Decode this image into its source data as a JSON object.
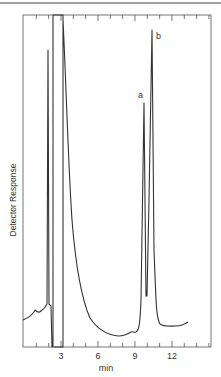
{
  "chart_data": {
    "type": "line",
    "title": "",
    "xlabel": "min",
    "ylabel": "Detector Response",
    "xlim": [
      0,
      15.2
    ],
    "x_ticks": [
      3,
      6,
      9,
      12
    ],
    "x_tick_labels": [
      "3",
      "6",
      "9",
      "12"
    ],
    "minor_tick_interval": 1,
    "grid": false,
    "legend": null,
    "annotations": [
      {
        "label": "a",
        "x": 9.7,
        "description": "first analyte peak"
      },
      {
        "label": "b",
        "x": 10.4,
        "description": "second analyte peak (tallest)"
      }
    ],
    "series": [
      {
        "name": "chromatogram",
        "x": [
          0.0,
          0.5,
          0.9,
          1.1,
          1.3,
          1.6,
          1.85,
          1.95,
          2.0,
          2.05,
          2.3,
          2.35,
          3.15,
          3.2,
          3.5,
          4.0,
          4.5,
          5.0,
          5.5,
          6.0,
          6.5,
          7.0,
          7.5,
          8.0,
          8.5,
          8.8,
          9.0,
          9.2,
          9.4,
          9.6,
          9.7,
          9.85,
          10.0,
          10.2,
          10.4,
          10.6,
          10.8,
          11.0,
          11.5,
          12.0,
          12.5,
          13.0
        ],
        "y_relative": [
          0.08,
          0.1,
          0.12,
          0.14,
          0.11,
          0.13,
          0.16,
          0.9,
          0.16,
          0.02,
          0.02,
          1.05,
          1.05,
          0.98,
          0.75,
          0.55,
          0.4,
          0.29,
          0.21,
          0.15,
          0.11,
          0.08,
          0.06,
          0.05,
          0.05,
          0.06,
          0.07,
          0.06,
          0.2,
          0.55,
          0.74,
          0.25,
          0.2,
          0.55,
          0.96,
          0.4,
          0.12,
          0.08,
          0.07,
          0.065,
          0.07,
          0.075
        ]
      }
    ]
  },
  "labels": {
    "x_axis": "min",
    "y_axis": "Detector Response",
    "peak_a": "a",
    "peak_b": "b",
    "tick_3": "3",
    "tick_6": "6",
    "tick_9": "9",
    "tick_12": "12"
  },
  "colors": {
    "line": "#333333",
    "frame": "#555555",
    "background": "#ffffff"
  }
}
